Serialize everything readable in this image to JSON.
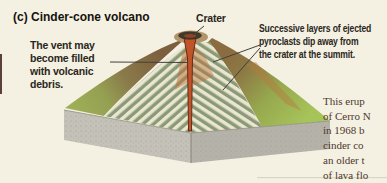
{
  "figure": {
    "panel_label": "(c)",
    "title": "Cinder-cone volcano"
  },
  "annotations": {
    "crater_label": "Crater",
    "vent_note": {
      "lines": [
        "The vent may",
        "become filled",
        "with volcanic",
        "debris."
      ]
    },
    "layers_note": {
      "lines": [
        "Successive layers of ejected",
        "pyroclasts dip away from",
        "the crater at the summit."
      ]
    }
  },
  "caption": {
    "lines": [
      "This erup",
      "of Cerro N",
      "in 1968 b",
      "cinder co",
      "an older t",
      "of lava flo"
    ]
  },
  "colors": {
    "background": "#f4f1e3",
    "label_text": "#2b2620",
    "caption_text": "#4e382b",
    "vent_red": "#c05327",
    "vent_outline": "#5a2114",
    "grass_green": "#a2c157",
    "slope_brown": "#8a6b45",
    "rock_gray": "#bdbbb2",
    "layer_cream": "#ebe6d2",
    "layer_olive": "#8a9a76",
    "crater_dark": "#42382c"
  }
}
